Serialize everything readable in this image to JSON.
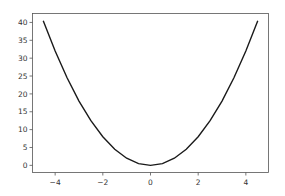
{
  "chart_data": {
    "type": "line",
    "title": "",
    "xlabel": "",
    "ylabel": "",
    "xlim": [
      -4.95,
      4.95
    ],
    "ylim": [
      -2.0,
      42.5
    ],
    "grid": false,
    "legend": null,
    "xticks": [
      -4,
      -2,
      0,
      2,
      4
    ],
    "xtick_labels": [
      "−4",
      "−2",
      "0",
      "2",
      "4"
    ],
    "yticks": [
      0,
      5,
      10,
      15,
      20,
      25,
      30,
      35,
      40
    ],
    "ytick_labels": [
      "0",
      "5",
      "10",
      "15",
      "20",
      "25",
      "30",
      "35",
      "40"
    ],
    "series": [
      {
        "name": "y = x^2",
        "color": "#1a1a1a",
        "x": [
          -4.5,
          -4.0,
          -3.5,
          -3.0,
          -2.5,
          -2.0,
          -1.5,
          -1.0,
          -0.5,
          0.0,
          0.5,
          1.0,
          1.5,
          2.0,
          2.5,
          3.0,
          3.5,
          4.0,
          4.5
        ],
        "y": [
          20.25,
          16.0,
          12.25,
          9.0,
          6.25,
          4.0,
          2.25,
          1.0,
          0.25,
          0.0,
          0.25,
          1.0,
          2.25,
          4.0,
          6.25,
          9.0,
          12.25,
          16.0,
          20.25
        ]
      }
    ]
  }
}
